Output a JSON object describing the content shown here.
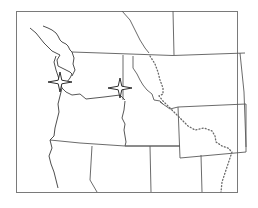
{
  "map": {
    "type": "outline-map",
    "region": "Pacific Northwest, United States",
    "colors": {
      "background": "#ffffff",
      "frame": "#7a7a7a",
      "state_border": "#5a5a5a",
      "coastline": "#3a3a3a",
      "marker": "#1a1a1a"
    },
    "markers": [
      {
        "name": "star-marker-west",
        "icon": "four-point-star-icon",
        "x": 60,
        "y": 82
      },
      {
        "name": "star-marker-east",
        "icon": "four-point-star-icon",
        "x": 120,
        "y": 88
      }
    ],
    "features": {
      "dotted_line": "continental-divide",
      "frame": [
        17,
        11,
        238,
        194
      ]
    }
  }
}
